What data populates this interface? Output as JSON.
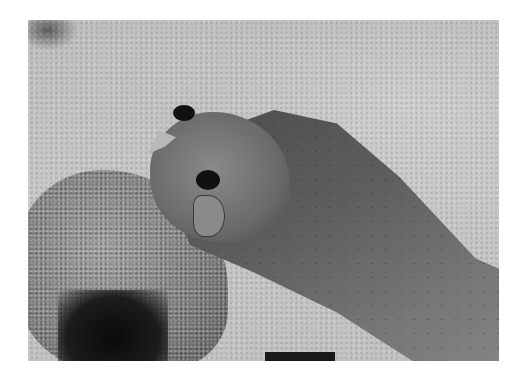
{
  "image": {
    "description": "Black-and-white photograph of a snake's head emerging over a sandy rock, body extending toward lower right",
    "colors": {
      "background": "#ffffff",
      "sand": "#c4c4c4",
      "snake_dark": "#4a4a4a",
      "snake_light": "#8a8a8a",
      "hole": "#0a0a0a"
    }
  }
}
